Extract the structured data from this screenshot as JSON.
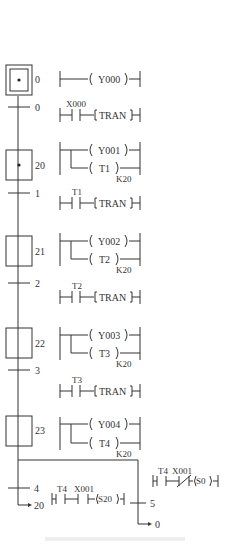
{
  "diagram": {
    "type": "SFC with ladder equivalents",
    "steps": [
      {
        "id": "0",
        "initial": true,
        "active": true,
        "outputs": [
          "Y000"
        ]
      },
      {
        "id": "20",
        "active": true,
        "outputs": [
          "Y001",
          "T1"
        ],
        "timer_const": "K20"
      },
      {
        "id": "21",
        "outputs": [
          "Y002",
          "T2"
        ],
        "timer_const": "K20"
      },
      {
        "id": "22",
        "outputs": [
          "Y003",
          "T3"
        ],
        "timer_const": "K20"
      },
      {
        "id": "23",
        "outputs": [
          "Y004",
          "T4"
        ],
        "timer_const": "K20"
      }
    ],
    "transitions": [
      {
        "id": "0",
        "contact": "X000",
        "coil": "TRAN"
      },
      {
        "id": "1",
        "contact": "T1",
        "coil": "TRAN"
      },
      {
        "id": "2",
        "contact": "T2",
        "coil": "TRAN"
      },
      {
        "id": "3",
        "contact": "T3",
        "coil": "TRAN"
      },
      {
        "id": "4",
        "contacts": [
          "T4",
          "X001"
        ],
        "coil": "S20",
        "jump_to": "20"
      },
      {
        "id": "5",
        "contacts": [
          "T4",
          "X001 (NC)"
        ],
        "coil": "S0",
        "jump_to": "0"
      }
    ],
    "labels": {
      "s0": "0",
      "t0": "0",
      "s20": "20",
      "t1": "1",
      "s21": "21",
      "t2": "2",
      "s22": "22",
      "t3": "3",
      "s23": "23",
      "t4": "4",
      "t5": "5",
      "jump20": "20",
      "jump0": "0",
      "y000": "Y000",
      "y001": "Y001",
      "y002": "Y002",
      "y003": "Y003",
      "y004": "Y004",
      "tm1": "T1",
      "tm2": "T2",
      "tm3": "T3",
      "tm4": "T4",
      "k": "K20",
      "tran": "TRAN",
      "x000": "X000",
      "x001": "X001",
      "s20coil": "S20",
      "s0coil": "S0"
    }
  }
}
